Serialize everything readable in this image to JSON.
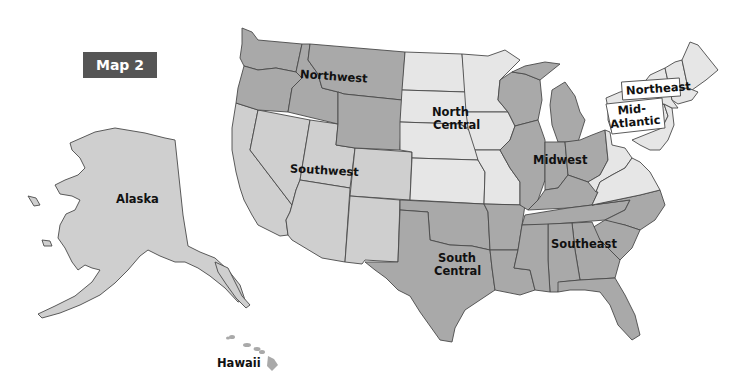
{
  "title": "Map 2",
  "map": {
    "type": "choropleth-regions",
    "subject": "United States regions",
    "colors": {
      "dark": "#a9a9a9",
      "mid": "#cfcfcf",
      "light": "#e6e6e6",
      "badge": "#555555",
      "border": "#4a4a4a"
    },
    "regions": [
      {
        "id": "northwest",
        "label": "Northwest",
        "shade": "dark"
      },
      {
        "id": "north-central",
        "label_line1": "North",
        "label_line2": "Central",
        "shade": "light"
      },
      {
        "id": "southwest",
        "label": "Southwest",
        "shade": "mid"
      },
      {
        "id": "south-central",
        "label_line1": "South",
        "label_line2": "Central",
        "shade": "dark"
      },
      {
        "id": "midwest",
        "label": "Midwest",
        "shade": "dark"
      },
      {
        "id": "southeast",
        "label": "Southeast",
        "shade": "dark"
      },
      {
        "id": "northeast",
        "label": "Northeast",
        "shade": "light"
      },
      {
        "id": "mid-atlantic",
        "label_line1": "Mid-",
        "label_line2": "Atlantic",
        "shade": "light"
      },
      {
        "id": "alaska",
        "label": "Alaska",
        "shade": "mid"
      },
      {
        "id": "hawaii",
        "label": "Hawaii",
        "shade": "dark"
      }
    ]
  }
}
